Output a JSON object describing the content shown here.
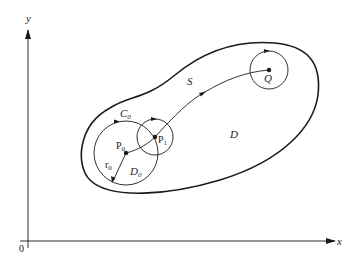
{
  "diagram": {
    "axes": {
      "x_label": "x",
      "y_label": "y",
      "origin_label": "0"
    },
    "regions": {
      "domain_label": "D",
      "path_label": "S"
    },
    "points": {
      "p0": {
        "label": "P",
        "sub": "0"
      },
      "p1": {
        "label": "P",
        "sub": "1"
      },
      "q": {
        "label": "Q"
      }
    },
    "circles": {
      "c0": {
        "label": "C",
        "sub": "0"
      },
      "d0": {
        "label": "D",
        "sub": "0"
      },
      "r0": {
        "label": "r",
        "sub": "0"
      }
    },
    "colors": {
      "stroke": "#1a1a1a",
      "background": "#ffffff"
    }
  }
}
